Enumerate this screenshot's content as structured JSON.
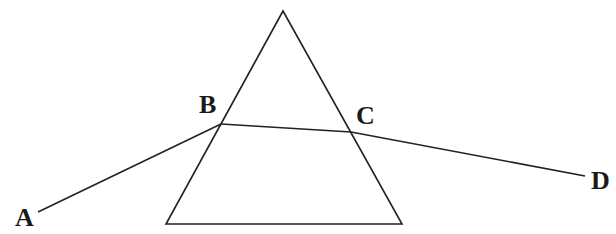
{
  "diagram": {
    "title": "",
    "stroke_color": "#222222",
    "prism": {
      "apex": [
        283,
        11
      ],
      "bottom_left": [
        166,
        224
      ],
      "bottom_right": [
        402,
        224
      ]
    },
    "ray": {
      "points": {
        "A": [
          38,
          212
        ],
        "B": [
          221,
          124
        ],
        "C": [
          351,
          132
        ],
        "D": [
          585,
          176
        ]
      },
      "segments": [
        [
          "A",
          "B"
        ],
        [
          "B",
          "C"
        ],
        [
          "C",
          "D"
        ]
      ]
    },
    "labels": {
      "A": "A",
      "B": "B",
      "C": "C",
      "D": "D"
    }
  }
}
